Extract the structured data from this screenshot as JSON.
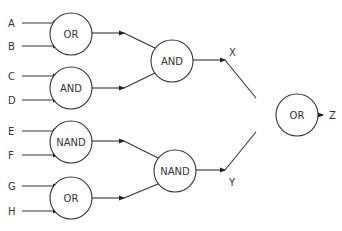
{
  "diagram": {
    "type": "logic-gate-tree",
    "inputs": [
      {
        "label": "A",
        "x": 8,
        "y": 23
      },
      {
        "label": "B",
        "x": 8,
        "y": 46
      },
      {
        "label": "C",
        "x": 8,
        "y": 76
      },
      {
        "label": "D",
        "x": 8,
        "y": 100
      },
      {
        "label": "E",
        "x": 8,
        "y": 131
      },
      {
        "label": "F",
        "x": 8,
        "y": 155
      },
      {
        "label": "G",
        "x": 8,
        "y": 186
      },
      {
        "label": "H",
        "x": 8,
        "y": 211
      }
    ],
    "gates": [
      {
        "id": "g1",
        "label": "OR",
        "cx": 71,
        "cy": 34,
        "r": 21,
        "inputs": [
          "A",
          "B"
        ]
      },
      {
        "id": "g2",
        "label": "AND",
        "cx": 71,
        "cy": 88,
        "r": 21,
        "inputs": [
          "C",
          "D"
        ]
      },
      {
        "id": "g3",
        "label": "NAND",
        "cx": 71,
        "cy": 142,
        "r": 21,
        "inputs": [
          "E",
          "F"
        ]
      },
      {
        "id": "g4",
        "label": "OR",
        "cx": 71,
        "cy": 198,
        "r": 21,
        "inputs": [
          "G",
          "H"
        ]
      },
      {
        "id": "g5",
        "label": "AND",
        "cx": 172,
        "cy": 61,
        "r": 21,
        "inputs": [
          "g1",
          "g2"
        ]
      },
      {
        "id": "g6",
        "label": "NAND",
        "cx": 175,
        "cy": 171,
        "r": 21,
        "inputs": [
          "g3",
          "g4"
        ]
      },
      {
        "id": "g7",
        "label": "OR",
        "cx": 297,
        "cy": 115,
        "r": 21,
        "inputs": [
          "X",
          "Y"
        ]
      }
    ],
    "intermediate": [
      {
        "label": "X",
        "x": 229,
        "y": 56
      },
      {
        "label": "Y",
        "x": 229,
        "y": 185
      }
    ],
    "output": {
      "label": "Z",
      "x": 331,
      "y": 119
    }
  }
}
